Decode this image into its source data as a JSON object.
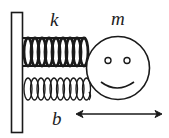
{
  "diagram": {
    "type": "mass-spring-damper",
    "labels": {
      "spring_constant": "k",
      "mass": "m",
      "damping": "b"
    },
    "colors": {
      "stroke": "#1a1a1a",
      "background": "#ffffff"
    },
    "components": [
      {
        "id": "wall",
        "description": "fixed wall (rectangle)"
      },
      {
        "id": "spring",
        "label": "k",
        "coils": 9
      },
      {
        "id": "damper-spring",
        "label": "b",
        "coils": 10
      },
      {
        "id": "mass",
        "label": "m",
        "shape": "smiley-face circle"
      },
      {
        "id": "motion-arrow",
        "description": "double-headed horizontal arrow"
      }
    ]
  }
}
